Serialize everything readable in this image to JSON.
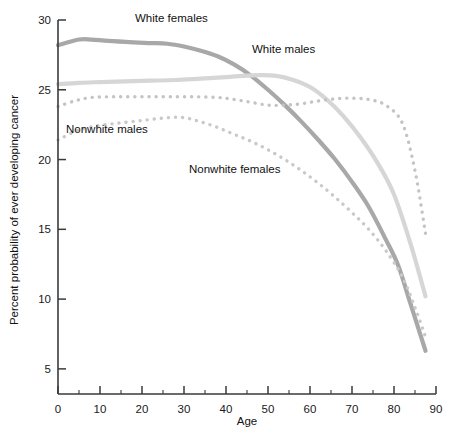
{
  "chart_data": {
    "type": "line",
    "title": "",
    "xlabel": "Age",
    "ylabel": "Percent probability of ever developing cancer",
    "xlim": [
      0,
      90
    ],
    "ylim": [
      3.2,
      30
    ],
    "xticks": [
      0,
      10,
      20,
      30,
      40,
      50,
      60,
      70,
      80,
      90
    ],
    "xticklabels": [
      "0",
      "10",
      "20",
      "30",
      "40",
      "50",
      "60",
      "70",
      "80",
      "90"
    ],
    "xminorticks": [
      5,
      15,
      25,
      35,
      45,
      55,
      65,
      75,
      85
    ],
    "yticks": [
      5,
      10,
      15,
      20,
      25,
      30
    ],
    "yticklabels": [
      "5",
      "10",
      "15",
      "20",
      "25",
      "30"
    ],
    "grid": false,
    "legend_position": "inline-annotations",
    "series": [
      {
        "name": "White females",
        "style": "solid",
        "color": "#a8a8a8",
        "width": 4.2,
        "label_x": 135,
        "label_y": 22,
        "x": [
          0,
          5,
          8,
          12,
          18,
          22,
          26,
          30,
          34,
          38,
          42,
          46,
          50,
          54,
          58,
          62,
          66,
          70,
          74,
          78,
          81,
          84,
          87.5
        ],
        "y": [
          28.2,
          28.6,
          28.6,
          28.5,
          28.4,
          28.35,
          28.3,
          28.1,
          27.8,
          27.4,
          26.8,
          26.0,
          25.0,
          23.9,
          22.7,
          21.4,
          20.0,
          18.4,
          16.6,
          14.3,
          12.4,
          9.6,
          6.3
        ]
      },
      {
        "name": "White males",
        "style": "solid",
        "color": "#d6d6d6",
        "width": 4.2,
        "label_x": 252,
        "label_y": 53,
        "x": [
          0,
          5,
          10,
          16,
          22,
          28,
          34,
          40,
          44,
          48,
          52,
          56,
          60,
          64,
          68,
          72,
          76,
          80,
          84,
          87.5
        ],
        "y": [
          25.4,
          25.5,
          25.55,
          25.6,
          25.65,
          25.7,
          25.8,
          25.9,
          26.0,
          26.05,
          26.0,
          25.7,
          25.2,
          24.3,
          23.1,
          21.6,
          19.8,
          17.5,
          13.9,
          10.2
        ]
      },
      {
        "name": "Nonwhite males",
        "style": "dotted",
        "color": "#c4c4c4",
        "width": 3.4,
        "label_x": 66,
        "label_y": 133,
        "x": [
          0,
          4,
          8,
          14,
          20,
          26,
          32,
          38,
          42,
          46,
          50,
          54,
          58,
          62,
          66,
          70,
          74,
          78,
          82,
          85,
          87.5
        ],
        "y": [
          23.8,
          24.2,
          24.45,
          24.5,
          24.5,
          24.5,
          24.5,
          24.45,
          24.3,
          24.1,
          23.9,
          23.9,
          24.0,
          24.2,
          24.35,
          24.4,
          24.3,
          23.9,
          22.6,
          19.2,
          14.7
        ]
      },
      {
        "name": "Nonwhite females",
        "style": "dotted",
        "color": "#c9c9c9",
        "width": 3.4,
        "label_x": 189,
        "label_y": 173,
        "x": [
          0,
          4,
          8,
          14,
          20,
          26,
          30,
          34,
          38,
          42,
          46,
          50,
          54,
          58,
          62,
          66,
          70,
          74,
          78,
          82,
          85,
          87.5
        ],
        "y": [
          21.4,
          22.0,
          22.35,
          22.6,
          22.8,
          23.0,
          23.0,
          22.7,
          22.3,
          21.8,
          21.3,
          20.7,
          20.0,
          19.2,
          18.3,
          17.3,
          16.2,
          15.0,
          13.5,
          11.6,
          9.4,
          7.3
        ]
      }
    ]
  },
  "axis": {
    "x_title": "Age",
    "y_title": "Percent probability of ever developing cancer"
  }
}
